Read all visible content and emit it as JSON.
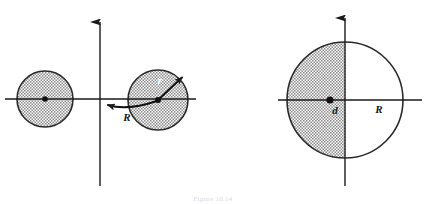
{
  "figure": {
    "caption": "Figure 10.14",
    "colors": {
      "ink": "#1a1a1a",
      "shade_fill": "#b9b9b9",
      "outline": "#2b2b2b",
      "background": "#ffffff",
      "light_label": "#ffffff",
      "caption": "#d8d8d8"
    },
    "panels": [
      {
        "id": "left-panel",
        "name": "two-spheres-panel",
        "axes": {
          "x_axis": {
            "x1": 5,
            "y1": 99,
            "x2": 196,
            "y2": 99,
            "arrow": false
          },
          "y_axis": {
            "x1": 100,
            "y1": 186,
            "x2": 100,
            "y2": 14,
            "arrow": true
          }
        },
        "origin": {
          "x": 100,
          "y": 99
        },
        "shapes": [
          {
            "name": "left-shaded-sphere",
            "type": "circle",
            "cx": 45,
            "cy": 99,
            "r": 28,
            "shaded": "full",
            "center_dot": true
          },
          {
            "name": "right-shaded-sphere",
            "type": "circle",
            "cx": 158,
            "cy": 100,
            "r": 30,
            "shaded": "full",
            "center_dot": true
          }
        ],
        "vectors": [
          {
            "name": "R-vector",
            "label": "R",
            "label_x": 127,
            "label_y": 121,
            "label_color": "dark",
            "from": {
              "x": 158,
              "y": 100
            },
            "to": {
              "x": 103,
              "y": 100
            },
            "curved": true
          },
          {
            "name": "r-vector",
            "label": "r",
            "label_x": 160,
            "label_y": 83,
            "label_color": "light",
            "from": {
              "x": 158,
              "y": 100
            },
            "to": {
              "x": 185,
              "y": 75
            },
            "curved": false
          }
        ]
      },
      {
        "id": "right-panel",
        "name": "half-shaded-sphere-panel",
        "axes": {
          "x_axis": {
            "x1": 278,
            "y1": 100,
            "x2": 422,
            "y2": 100,
            "arrow": false
          },
          "y_axis": {
            "x1": 345,
            "y1": 186,
            "x2": 345,
            "y2": 10,
            "arrow": true
          }
        },
        "origin": {
          "x": 345,
          "y": 100
        },
        "shapes": [
          {
            "name": "half-shaded-sphere",
            "type": "circle",
            "cx": 345,
            "cy": 100,
            "r": 58,
            "shaded": "left-half",
            "center_dot": false
          }
        ],
        "markers": [
          {
            "name": "offset-center-dot",
            "x": 330,
            "y": 100
          }
        ],
        "labels": [
          {
            "name": "d-label",
            "text": "d",
            "x": 334,
            "y": 113,
            "color": "dark"
          },
          {
            "name": "R-label",
            "text": "R",
            "x": 378,
            "y": 112,
            "color": "dark"
          }
        ]
      }
    ]
  }
}
